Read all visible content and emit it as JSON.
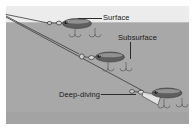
{
  "diagram": {
    "labels": [
      {
        "id": "surface",
        "text": "Surface"
      },
      {
        "id": "subsurface",
        "text": "Subsurface"
      },
      {
        "id": "deepdiving",
        "text": "Deep-diving"
      }
    ],
    "colors": {
      "sky": "#ececec",
      "water": "#a8a8a8",
      "waterline": "#bdbdbd",
      "lure_body": "#5e5e5e",
      "lure_highlight": "#bfbfbf",
      "line": "#3a3a3a",
      "hook": "#d9d9d9",
      "text": "#1b1b1b",
      "page": "#ffffff"
    },
    "lures": [
      {
        "id": "surface-lure",
        "depth_label": "Surface",
        "has_diving_lip": false,
        "hooks": 2
      },
      {
        "id": "subsurface-lure",
        "depth_label": "Subsurface",
        "has_diving_lip": false,
        "hooks": 2
      },
      {
        "id": "deep-lure",
        "depth_label": "Deep-diving",
        "has_diving_lip": true,
        "hooks": 2
      }
    ],
    "lines": [
      {
        "id": "line-surface",
        "from": "rod-tip",
        "to": "surface-lure"
      },
      {
        "id": "line-subsurface",
        "from": "rod-tip",
        "to": "subsurface-lure"
      },
      {
        "id": "line-deep",
        "from": "rod-tip",
        "to": "deep-lure"
      }
    ]
  }
}
